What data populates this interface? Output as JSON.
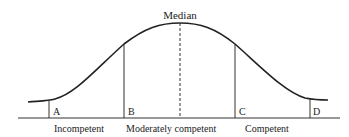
{
  "diagram": {
    "title_label": "Median",
    "markers": [
      {
        "id": "A",
        "label": "A"
      },
      {
        "id": "B",
        "label": "B"
      },
      {
        "id": "C",
        "label": "C"
      },
      {
        "id": "D",
        "label": "D"
      }
    ],
    "regions": [
      {
        "label": "Incompetent"
      },
      {
        "label": "Moderately competent"
      },
      {
        "label": "Competent"
      }
    ],
    "colors": {
      "ink": "#222222",
      "background": "#ffffff"
    }
  }
}
